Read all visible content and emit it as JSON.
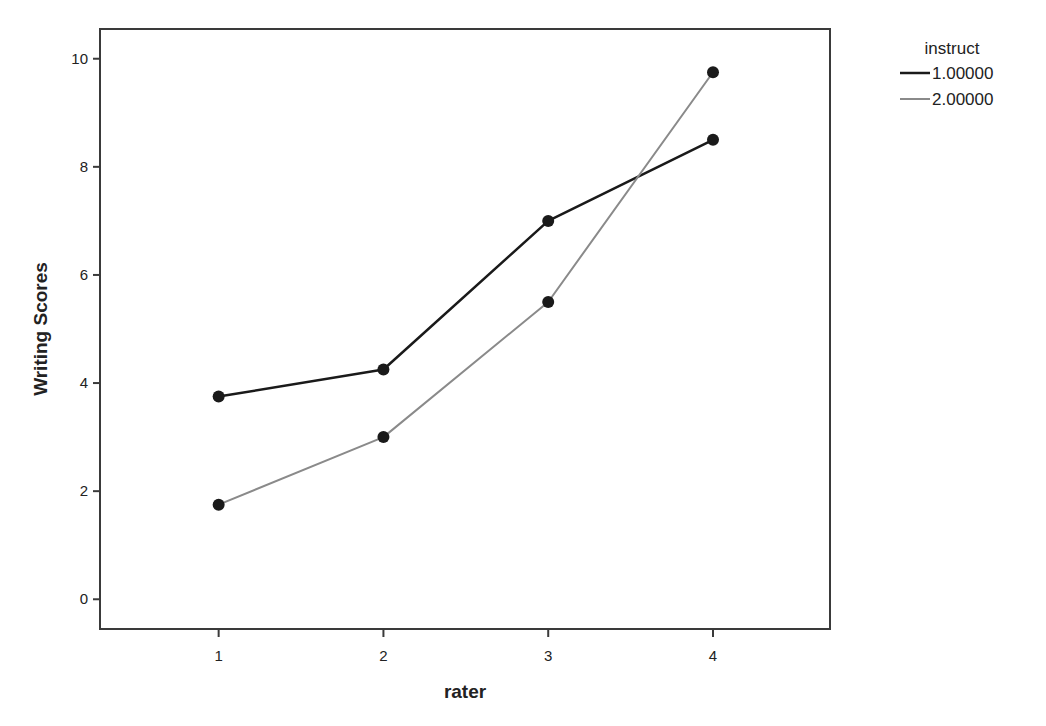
{
  "chart_data": {
    "type": "line",
    "title": "",
    "xlabel": "rater",
    "ylabel": "Writing Scores",
    "categories": [
      "1",
      "2",
      "3",
      "4"
    ],
    "x": [
      1,
      2,
      3,
      4
    ],
    "xlim": [
      0.28,
      4.71
    ],
    "ylim": [
      -0.55,
      10.55
    ],
    "yticks": [
      0,
      2,
      4,
      6,
      8,
      10
    ],
    "xticks": [
      1,
      2,
      3,
      4
    ],
    "grid": false,
    "legend": {
      "title": "instruct",
      "position": "top-right-outside"
    },
    "series": [
      {
        "name": "1.00000",
        "color": "#1a1a1a",
        "line_width": 2.5,
        "values": [
          3.75,
          4.25,
          7.0,
          8.5
        ]
      },
      {
        "name": "2.00000",
        "color": "#8a8a8a",
        "line_width": 2,
        "values": [
          1.75,
          3.0,
          5.5,
          9.75
        ]
      }
    ],
    "marker": {
      "shape": "circle",
      "color": "#1a1a1a",
      "radius": 6
    }
  }
}
